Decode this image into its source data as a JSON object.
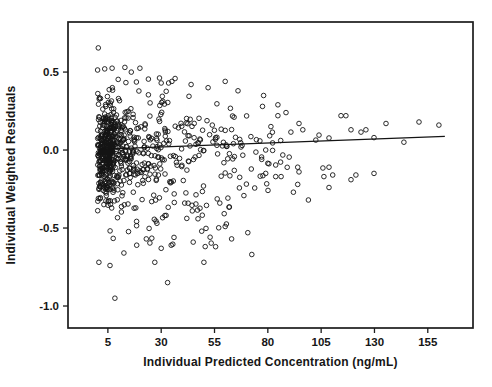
{
  "chart_data": {
    "type": "scatter",
    "title": "",
    "xlabel": "Individual Predicted Concentration (ng/mL)",
    "ylabel": "Individual Weighted Residuals",
    "xlim": [
      -13.7,
      176.2
    ],
    "ylim": [
      -1.141,
      0.821
    ],
    "xticks": [
      5,
      30,
      55,
      80,
      105,
      130,
      155
    ],
    "xtick_labels": [
      "5",
      "30",
      "55",
      "80",
      "105",
      "130",
      "155"
    ],
    "yticks": [
      0.5,
      0.0,
      -0.5,
      -1.0
    ],
    "ytick_labels": [
      "0.5",
      "0.0",
      "-0.5",
      "-1.0"
    ],
    "grid": false,
    "legend": "none",
    "axis_color": "#1c1c1c",
    "text_color": "#161616",
    "marker": {
      "shape": "open-circle",
      "radius": 2.3,
      "stroke_width": 0.9,
      "color": "#141414"
    },
    "trend_line": {
      "x1": 0,
      "y1": 0.004,
      "x2": 163,
      "y2": 0.088,
      "color": "#141414",
      "width": 1.3
    },
    "seed": 7,
    "points": [
      [
        0.5,
        0.655
      ],
      [
        0.2,
        0.513
      ],
      [
        7,
        0.525
      ],
      [
        13,
        0.53
      ],
      [
        20,
        0.525
      ],
      [
        3.5,
        0.52
      ],
      [
        16,
        0.5
      ],
      [
        24,
        0.455
      ],
      [
        35,
        0.44
      ],
      [
        30,
        0.43
      ],
      [
        44,
        0.42
      ],
      [
        52,
        0.4
      ],
      [
        60,
        0.44
      ],
      [
        66,
        0.38
      ],
      [
        78,
        0.35
      ],
      [
        77.5,
        0.28
      ],
      [
        84.7,
        0.29
      ],
      [
        84.7,
        0.22
      ],
      [
        88.5,
        0.24
      ],
      [
        90.8,
        0.115
      ],
      [
        94.6,
        0.17
      ],
      [
        96.4,
        0.13
      ],
      [
        102.5,
        0.064
      ],
      [
        104,
        0.096
      ],
      [
        108.7,
        0.077
      ],
      [
        114.3,
        0.22
      ],
      [
        116.6,
        0.22
      ],
      [
        119,
        0.13
      ],
      [
        123.7,
        0.115
      ],
      [
        126,
        0.13
      ],
      [
        129.8,
        0.08
      ],
      [
        135.4,
        0.17
      ],
      [
        143.8,
        0.05
      ],
      [
        150.9,
        0.18
      ],
      [
        160.2,
        0.16
      ],
      [
        74.4,
        -0.013
      ],
      [
        79,
        0.0
      ],
      [
        87,
        -0.032
      ],
      [
        90,
        -0.045
      ],
      [
        80,
        -0.085
      ],
      [
        83.7,
        -0.096
      ],
      [
        86,
        -0.077
      ],
      [
        94,
        -0.11
      ],
      [
        105.8,
        -0.115
      ],
      [
        108.7,
        -0.11
      ],
      [
        79,
        -0.15
      ],
      [
        83.7,
        -0.17
      ],
      [
        86.2,
        -0.17
      ],
      [
        94.6,
        -0.14
      ],
      [
        106.3,
        -0.17
      ],
      [
        110.4,
        -0.16
      ],
      [
        121.3,
        -0.16
      ],
      [
        129.8,
        -0.15
      ],
      [
        94,
        -0.22
      ],
      [
        108.7,
        -0.24
      ],
      [
        119,
        -0.19
      ],
      [
        99,
        -0.32
      ],
      [
        92,
        -0.27
      ],
      [
        41,
        -0.34
      ],
      [
        47,
        -0.385
      ],
      [
        57.5,
        -0.34
      ],
      [
        62,
        -0.365
      ],
      [
        31.7,
        -0.42
      ],
      [
        28,
        -0.47
      ],
      [
        60,
        -0.49
      ],
      [
        70.6,
        -0.53
      ],
      [
        25.6,
        -0.565
      ],
      [
        72.5,
        -0.67
      ],
      [
        27,
        -0.72
      ],
      [
        33,
        -0.85
      ],
      [
        8.3,
        -0.95
      ],
      [
        0.8,
        -0.72
      ],
      [
        6,
        -0.74
      ],
      [
        12.5,
        -0.66
      ],
      [
        18.5,
        -0.61
      ],
      [
        23,
        -0.57
      ],
      [
        36,
        -0.56
      ],
      [
        45,
        -0.59
      ],
      [
        50,
        -0.72
      ],
      [
        55.5,
        -0.62
      ],
      [
        63,
        -0.57
      ],
      [
        30,
        -0.63
      ]
    ],
    "point_clusters": [
      {
        "n": 340,
        "x": [
          0.2,
          8
        ],
        "dist": "gauss",
        "y_mean": 0.0,
        "y_sigma": 0.155,
        "y_clip": [
          -0.48,
          0.5
        ]
      },
      {
        "n": 140,
        "x": [
          8,
          18
        ],
        "dist": "gauss",
        "y_mean": 0.0,
        "y_sigma": 0.165,
        "y_clip": [
          -0.52,
          0.5
        ]
      },
      {
        "n": 90,
        "x": [
          18,
          32
        ],
        "dist": "gauss",
        "y_mean": 0.0,
        "y_sigma": 0.165,
        "y_clip": [
          -0.55,
          0.48
        ]
      },
      {
        "n": 60,
        "x": [
          32,
          50
        ],
        "dist": "gauss",
        "y_mean": 0.0,
        "y_sigma": 0.17,
        "y_clip": [
          -0.52,
          0.45
        ]
      },
      {
        "n": 44,
        "x": [
          50,
          70
        ],
        "dist": "gauss",
        "y_mean": -0.01,
        "y_sigma": 0.17,
        "y_clip": [
          -0.5,
          0.42
        ]
      },
      {
        "n": 20,
        "x": [
          70,
          90
        ],
        "dist": "gauss",
        "y_mean": -0.01,
        "y_sigma": 0.15,
        "y_clip": [
          -0.32,
          0.32
        ]
      },
      {
        "n": 36,
        "x": [
          1,
          62
        ],
        "dist": "uniform",
        "y": [
          -0.62,
          -0.34
        ]
      },
      {
        "n": 10,
        "x": [
          1,
          45
        ],
        "dist": "uniform",
        "y": [
          0.3,
          0.47
        ]
      }
    ]
  }
}
